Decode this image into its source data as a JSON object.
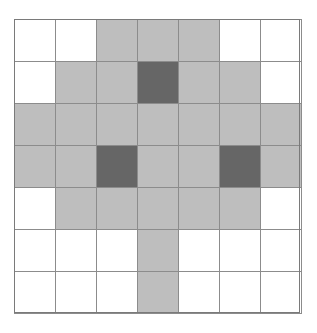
{
  "figure": {
    "name": "cellular-grid-matrix",
    "rows": 7,
    "columns": 7,
    "cell_width_px": 41,
    "cell_height_px": 42,
    "origin_x_px": 14,
    "origin_y_px": 19,
    "width_px": 286,
    "height_px": 294
  },
  "legend": {
    "states": [
      {
        "key": "empty",
        "label": "empty",
        "color": "#ffffff"
      },
      {
        "key": "light",
        "label": "light",
        "color": "#b2b2b2"
      },
      {
        "key": "dark",
        "label": "dark",
        "color": "#5b5b5b"
      }
    ],
    "grid_line_color": "#8c8c8c",
    "frame_color": "#7a7a7a",
    "background_color": "#ffffff"
  },
  "chart_data": {
    "type": "heatmap",
    "title": "",
    "subtitle": "",
    "xlabel": "",
    "ylabel": "",
    "grid": true,
    "legend_position": "none",
    "x": [
      1,
      2,
      3,
      4,
      5,
      6,
      7
    ],
    "y": [
      1,
      2,
      3,
      4,
      5,
      6,
      7
    ],
    "xtick_labels": [
      "",
      "",
      "",
      "",
      "",
      "",
      ""
    ],
    "ytick_labels": [
      "",
      "",
      "",
      "",
      "",
      "",
      ""
    ],
    "value_levels": [
      0,
      1,
      2
    ],
    "level_colors": [
      "#ffffff",
      "#b2b2b2",
      "#5b5b5b"
    ],
    "values": [
      [
        0,
        0,
        1,
        1,
        1,
        0,
        0
      ],
      [
        0,
        1,
        1,
        2,
        1,
        1,
        0
      ],
      [
        1,
        1,
        1,
        1,
        1,
        1,
        1
      ],
      [
        1,
        1,
        2,
        1,
        1,
        2,
        1
      ],
      [
        0,
        1,
        1,
        1,
        1,
        1,
        0
      ],
      [
        0,
        0,
        0,
        1,
        0,
        0,
        0
      ],
      [
        0,
        0,
        0,
        1,
        0,
        0,
        0
      ]
    ],
    "cells": [
      [
        {
          "state": "empty"
        },
        {
          "state": "empty"
        },
        {
          "state": "light"
        },
        {
          "state": "light"
        },
        {
          "state": "light"
        },
        {
          "state": "empty"
        },
        {
          "state": "empty"
        }
      ],
      [
        {
          "state": "empty"
        },
        {
          "state": "light"
        },
        {
          "state": "light"
        },
        {
          "state": "dark"
        },
        {
          "state": "light"
        },
        {
          "state": "light"
        },
        {
          "state": "empty"
        }
      ],
      [
        {
          "state": "light"
        },
        {
          "state": "light"
        },
        {
          "state": "light"
        },
        {
          "state": "light"
        },
        {
          "state": "light"
        },
        {
          "state": "light"
        },
        {
          "state": "light"
        }
      ],
      [
        {
          "state": "light"
        },
        {
          "state": "light"
        },
        {
          "state": "dark"
        },
        {
          "state": "light"
        },
        {
          "state": "light"
        },
        {
          "state": "dark"
        },
        {
          "state": "light"
        }
      ],
      [
        {
          "state": "empty"
        },
        {
          "state": "light"
        },
        {
          "state": "light"
        },
        {
          "state": "light"
        },
        {
          "state": "light"
        },
        {
          "state": "light"
        },
        {
          "state": "empty"
        }
      ],
      [
        {
          "state": "empty"
        },
        {
          "state": "empty"
        },
        {
          "state": "empty"
        },
        {
          "state": "light"
        },
        {
          "state": "empty"
        },
        {
          "state": "empty"
        },
        {
          "state": "empty"
        }
      ],
      [
        {
          "state": "empty"
        },
        {
          "state": "empty"
        },
        {
          "state": "empty"
        },
        {
          "state": "light"
        },
        {
          "state": "empty"
        },
        {
          "state": "empty"
        },
        {
          "state": "empty"
        }
      ]
    ]
  }
}
